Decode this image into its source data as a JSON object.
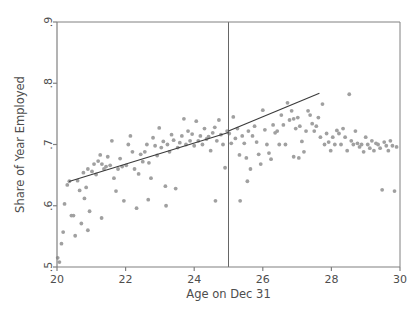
{
  "chart_data": {
    "type": "scatter",
    "title": "",
    "xlabel": "Age on Dec 31",
    "ylabel": "Share of Year Employed",
    "xlim": [
      20,
      30
    ],
    "ylim": [
      0.5,
      0.9
    ],
    "xticks": [
      20,
      22,
      24,
      26,
      28,
      30
    ],
    "xtick_labels": [
      "20",
      "22",
      "24",
      "26",
      "28",
      "30"
    ],
    "yticks": [
      0.5,
      0.6,
      0.7,
      0.8,
      0.9
    ],
    "ytick_labels": [
      ".5",
      ".6",
      ".7",
      ".8",
      ".9"
    ],
    "grid": false,
    "legend": null,
    "point_color": "#a0a0a0",
    "line_color": "#3a3a3a",
    "axis_color": "#808080",
    "cutoff_line_color": "#666666",
    "annotations": [
      {
        "name": "cutoff-vertical-line",
        "x": 25,
        "kind": "vline"
      }
    ],
    "fit_lines": [
      {
        "name": "left-fit",
        "x": [
          20.35,
          25.0
        ],
        "y": [
          0.6395,
          0.7195
        ]
      },
      {
        "name": "right-fit",
        "x": [
          25.0,
          27.65
        ],
        "y": [
          0.722,
          0.7835
        ]
      }
    ],
    "points": [
      [
        20.02,
        0.515
      ],
      [
        20.07,
        0.508
      ],
      [
        20.13,
        0.538
      ],
      [
        20.18,
        0.557
      ],
      [
        20.22,
        0.603
      ],
      [
        20.3,
        0.634
      ],
      [
        20.36,
        0.64
      ],
      [
        20.42,
        0.584
      ],
      [
        20.48,
        0.584
      ],
      [
        20.53,
        0.551
      ],
      [
        20.6,
        0.641
      ],
      [
        20.66,
        0.625
      ],
      [
        20.71,
        0.571
      ],
      [
        20.77,
        0.654
      ],
      [
        20.8,
        0.612
      ],
      [
        20.85,
        0.63
      ],
      [
        20.9,
        0.66
      ],
      [
        20.95,
        0.591
      ],
      [
        21.02,
        0.656
      ],
      [
        21.08,
        0.668
      ],
      [
        21.14,
        0.651
      ],
      [
        21.2,
        0.673
      ],
      [
        21.26,
        0.683
      ],
      [
        21.31,
        0.668
      ],
      [
        21.37,
        0.66
      ],
      [
        21.43,
        0.664
      ],
      [
        21.48,
        0.68
      ],
      [
        21.55,
        0.666
      ],
      [
        21.6,
        0.706
      ],
      [
        21.66,
        0.645
      ],
      [
        21.72,
        0.624
      ],
      [
        21.78,
        0.66
      ],
      [
        21.84,
        0.677
      ],
      [
        21.9,
        0.664
      ],
      [
        21.95,
        0.608
      ],
      [
        22.02,
        0.666
      ],
      [
        22.08,
        0.7
      ],
      [
        22.14,
        0.714
      ],
      [
        22.2,
        0.688
      ],
      [
        22.26,
        0.66
      ],
      [
        22.32,
        0.596
      ],
      [
        22.38,
        0.652
      ],
      [
        22.44,
        0.684
      ],
      [
        22.5,
        0.672
      ],
      [
        22.56,
        0.688
      ],
      [
        22.62,
        0.7
      ],
      [
        22.68,
        0.67
      ],
      [
        22.74,
        0.645
      ],
      [
        22.8,
        0.711
      ],
      [
        22.86,
        0.698
      ],
      [
        22.92,
        0.682
      ],
      [
        22.98,
        0.727
      ],
      [
        23.04,
        0.695
      ],
      [
        23.1,
        0.705
      ],
      [
        23.16,
        0.632
      ],
      [
        23.22,
        0.7
      ],
      [
        23.28,
        0.688
      ],
      [
        23.34,
        0.716
      ],
      [
        23.4,
        0.707
      ],
      [
        23.46,
        0.628
      ],
      [
        23.52,
        0.695
      ],
      [
        23.58,
        0.703
      ],
      [
        23.64,
        0.714
      ],
      [
        23.7,
        0.742
      ],
      [
        23.76,
        0.7
      ],
      [
        23.82,
        0.722
      ],
      [
        23.88,
        0.706
      ],
      [
        23.94,
        0.717
      ],
      [
        24.0,
        0.698
      ],
      [
        24.06,
        0.738
      ],
      [
        24.12,
        0.706
      ],
      [
        24.18,
        0.714
      ],
      [
        24.24,
        0.7
      ],
      [
        24.3,
        0.726
      ],
      [
        24.36,
        0.709
      ],
      [
        24.42,
        0.713
      ],
      [
        24.48,
        0.69
      ],
      [
        24.54,
        0.719
      ],
      [
        24.6,
        0.728
      ],
      [
        24.66,
        0.706
      ],
      [
        24.72,
        0.74
      ],
      [
        24.78,
        0.716
      ],
      [
        24.84,
        0.7
      ],
      [
        24.9,
        0.662
      ],
      [
        24.96,
        0.722
      ],
      [
        25.02,
        0.718
      ],
      [
        25.08,
        0.702
      ],
      [
        25.14,
        0.745
      ],
      [
        25.2,
        0.71
      ],
      [
        25.26,
        0.726
      ],
      [
        25.32,
        0.683
      ],
      [
        25.34,
        0.608
      ],
      [
        25.4,
        0.714
      ],
      [
        25.46,
        0.702
      ],
      [
        25.52,
        0.678
      ],
      [
        25.58,
        0.722
      ],
      [
        25.64,
        0.66
      ],
      [
        25.7,
        0.714
      ],
      [
        25.76,
        0.73
      ],
      [
        25.82,
        0.704
      ],
      [
        25.88,
        0.684
      ],
      [
        25.94,
        0.668
      ],
      [
        26.0,
        0.756
      ],
      [
        26.06,
        0.724
      ],
      [
        26.12,
        0.7
      ],
      [
        26.18,
        0.686
      ],
      [
        26.24,
        0.676
      ],
      [
        26.3,
        0.732
      ],
      [
        26.36,
        0.719
      ],
      [
        26.42,
        0.722
      ],
      [
        26.48,
        0.7
      ],
      [
        26.54,
        0.748
      ],
      [
        26.6,
        0.732
      ],
      [
        26.66,
        0.7
      ],
      [
        26.72,
        0.768
      ],
      [
        26.78,
        0.74
      ],
      [
        26.84,
        0.755
      ],
      [
        26.9,
        0.742
      ],
      [
        26.96,
        0.726
      ],
      [
        27.02,
        0.744
      ],
      [
        27.08,
        0.73
      ],
      [
        27.14,
        0.705
      ],
      [
        27.2,
        0.688
      ],
      [
        27.26,
        0.722
      ],
      [
        27.32,
        0.755
      ],
      [
        27.38,
        0.748
      ],
      [
        27.44,
        0.734
      ],
      [
        27.5,
        0.722
      ],
      [
        27.56,
        0.73
      ],
      [
        27.62,
        0.744
      ],
      [
        27.68,
        0.712
      ],
      [
        27.74,
        0.766
      ],
      [
        27.8,
        0.7
      ],
      [
        27.86,
        0.718
      ],
      [
        27.92,
        0.704
      ],
      [
        27.98,
        0.69
      ],
      [
        28.04,
        0.712
      ],
      [
        28.1,
        0.7
      ],
      [
        28.16,
        0.723
      ],
      [
        28.22,
        0.718
      ],
      [
        28.28,
        0.7
      ],
      [
        28.34,
        0.726
      ],
      [
        28.4,
        0.712
      ],
      [
        28.46,
        0.69
      ],
      [
        28.52,
        0.782
      ],
      [
        28.58,
        0.706
      ],
      [
        28.64,
        0.7
      ],
      [
        28.7,
        0.722
      ],
      [
        28.76,
        0.702
      ],
      [
        28.82,
        0.696
      ],
      [
        28.88,
        0.7
      ],
      [
        28.94,
        0.688
      ],
      [
        29.0,
        0.712
      ],
      [
        29.06,
        0.7
      ],
      [
        29.12,
        0.694
      ],
      [
        29.18,
        0.706
      ],
      [
        29.24,
        0.69
      ],
      [
        29.3,
        0.702
      ],
      [
        29.36,
        0.7
      ],
      [
        29.42,
        0.694
      ],
      [
        29.48,
        0.626
      ],
      [
        29.54,
        0.704
      ],
      [
        29.6,
        0.698
      ],
      [
        29.66,
        0.69
      ],
      [
        29.72,
        0.706
      ],
      [
        29.78,
        0.698
      ],
      [
        29.84,
        0.624
      ],
      [
        29.9,
        0.696
      ],
      [
        24.62,
        0.608
      ],
      [
        23.18,
        0.6
      ],
      [
        22.66,
        0.61
      ],
      [
        21.3,
        0.58
      ],
      [
        20.9,
        0.56
      ],
      [
        25.55,
        0.64
      ],
      [
        26.9,
        0.68
      ],
      [
        27.05,
        0.678
      ]
    ]
  },
  "plot_geometry": {
    "left": 57,
    "right": 400,
    "top": 22,
    "bottom": 267
  }
}
